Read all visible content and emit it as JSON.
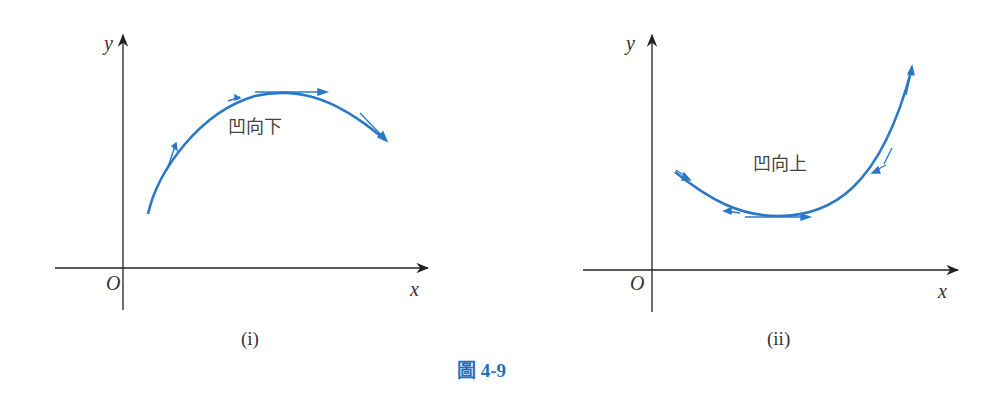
{
  "figure": {
    "caption": "圖 4-9",
    "curve_color": "#2b78c5",
    "axis_color": "#222222"
  },
  "panels": [
    {
      "id": "i",
      "sublabel": "(i)",
      "curve_label": "凹向下",
      "axes": {
        "x_label": "x",
        "y_label": "y",
        "origin_label": "O"
      }
    },
    {
      "id": "ii",
      "sublabel": "(ii)",
      "curve_label": "凹向上",
      "axes": {
        "x_label": "x",
        "y_label": "y",
        "origin_label": "O"
      }
    }
  ]
}
